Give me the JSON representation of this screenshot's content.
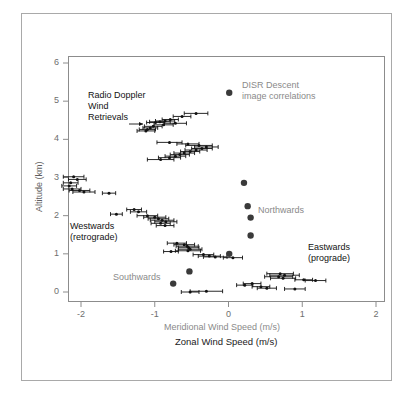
{
  "figure": {
    "title": "",
    "background": "#ffffff",
    "frame_color": "#a9a9a9"
  },
  "chart_data": {
    "type": "scatter",
    "title": "",
    "xlabel": "Zonal Wind Speed (m/s)",
    "xlabel_secondary": "Meridional Wind Speed (m/s)",
    "ylabel": "Altitude (km)",
    "xlim": [
      -2.3,
      2.1
    ],
    "ylim": [
      -0.25,
      6.35
    ],
    "xticks": [
      -2,
      -1,
      0,
      1,
      2
    ],
    "xtick_labels": [
      "-2",
      "-1",
      "0",
      "1",
      "2"
    ],
    "yticks": [
      0,
      1,
      2,
      3,
      4,
      5,
      6
    ],
    "ytick_labels": [
      "0",
      "1",
      "2",
      "3",
      "4",
      "5",
      "6"
    ],
    "grid": false,
    "legend_position": "upper-center",
    "series": [
      {
        "name": "Radio Doppler Wind Retrievals",
        "marker": "small-dot-with-horizontal-errorbar",
        "color": "#111111",
        "xlabel_axis": "Zonal Wind Speed (m/s)",
        "points": [
          {
            "x": -0.44,
            "y": 4.68,
            "xerr": 0.16
          },
          {
            "x": -0.63,
            "y": 4.6,
            "xerr": 0.12
          },
          {
            "x": -0.79,
            "y": 4.52,
            "xerr": 0.11
          },
          {
            "x": -0.86,
            "y": 4.48,
            "xerr": 0.13
          },
          {
            "x": -0.93,
            "y": 4.46,
            "xerr": 0.14
          },
          {
            "x": -0.99,
            "y": 4.44,
            "xerr": 0.12
          },
          {
            "x": -0.72,
            "y": 4.42,
            "xerr": 0.15
          },
          {
            "x": -0.88,
            "y": 4.38,
            "xerr": 0.13
          },
          {
            "x": -1.02,
            "y": 4.34,
            "xerr": 0.12
          },
          {
            "x": -1.06,
            "y": 4.3,
            "xerr": 0.1
          },
          {
            "x": -1.1,
            "y": 4.26,
            "xerr": 0.11
          },
          {
            "x": -1.12,
            "y": 4.22,
            "xerr": 0.12
          },
          {
            "x": -0.8,
            "y": 3.92,
            "xerr": 0.17
          },
          {
            "x": -0.55,
            "y": 3.88,
            "xerr": 0.15
          },
          {
            "x": -0.4,
            "y": 3.84,
            "xerr": 0.18
          },
          {
            "x": -0.3,
            "y": 3.8,
            "xerr": 0.16
          },
          {
            "x": -0.36,
            "y": 3.76,
            "xerr": 0.14
          },
          {
            "x": -0.44,
            "y": 3.72,
            "xerr": 0.15
          },
          {
            "x": -0.52,
            "y": 3.68,
            "xerr": 0.13
          },
          {
            "x": -0.6,
            "y": 3.64,
            "xerr": 0.14
          },
          {
            "x": -0.66,
            "y": 3.6,
            "xerr": 0.13
          },
          {
            "x": -0.72,
            "y": 3.56,
            "xerr": 0.14
          },
          {
            "x": -0.8,
            "y": 3.52,
            "xerr": 0.15
          },
          {
            "x": -0.92,
            "y": 3.47,
            "xerr": 0.18
          },
          {
            "x": -2.1,
            "y": 3.02,
            "xerr": 0.14
          },
          {
            "x": -2.05,
            "y": 2.95,
            "xerr": 0.12
          },
          {
            "x": -2.14,
            "y": 2.86,
            "xerr": 0.1
          },
          {
            "x": -2.16,
            "y": 2.78,
            "xerr": 0.1
          },
          {
            "x": -2.12,
            "y": 2.7,
            "xerr": 0.12
          },
          {
            "x": -2.02,
            "y": 2.66,
            "xerr": 0.14
          },
          {
            "x": -1.96,
            "y": 2.62,
            "xerr": 0.15
          },
          {
            "x": -1.62,
            "y": 2.59,
            "xerr": 0.09
          },
          {
            "x": -1.28,
            "y": 2.16,
            "xerr": 0.1
          },
          {
            "x": -1.22,
            "y": 2.1,
            "xerr": 0.11
          },
          {
            "x": -1.52,
            "y": 2.04,
            "xerr": 0.08
          },
          {
            "x": -1.1,
            "y": 2.0,
            "xerr": 0.14
          },
          {
            "x": -1.0,
            "y": 1.96,
            "xerr": 0.15
          },
          {
            "x": -0.95,
            "y": 1.92,
            "xerr": 0.14
          },
          {
            "x": -0.9,
            "y": 1.88,
            "xerr": 0.16
          },
          {
            "x": -0.85,
            "y": 1.84,
            "xerr": 0.15
          },
          {
            "x": -0.92,
            "y": 1.8,
            "xerr": 0.13
          },
          {
            "x": -0.86,
            "y": 1.74,
            "xerr": 0.12
          },
          {
            "x": -0.7,
            "y": 1.28,
            "xerr": 0.13
          },
          {
            "x": -0.6,
            "y": 1.24,
            "xerr": 0.14
          },
          {
            "x": -0.56,
            "y": 1.2,
            "xerr": 0.15
          },
          {
            "x": -0.54,
            "y": 1.16,
            "xerr": 0.14
          },
          {
            "x": -0.52,
            "y": 1.12,
            "xerr": 0.16
          },
          {
            "x": -0.55,
            "y": 1.08,
            "xerr": 0.17
          },
          {
            "x": -0.78,
            "y": 1.06,
            "xerr": 0.1
          },
          {
            "x": -0.34,
            "y": 0.98,
            "xerr": 0.14
          },
          {
            "x": -0.26,
            "y": 0.94,
            "xerr": 0.15
          },
          {
            "x": -0.18,
            "y": 0.92,
            "xerr": 0.16
          },
          {
            "x": 0.06,
            "y": 0.9,
            "xerr": 0.13
          },
          {
            "x": 0.7,
            "y": 0.48,
            "xerr": 0.18
          },
          {
            "x": 0.76,
            "y": 0.44,
            "xerr": 0.2
          },
          {
            "x": 0.68,
            "y": 0.4,
            "xerr": 0.19
          },
          {
            "x": 0.74,
            "y": 0.36,
            "xerr": 0.17
          },
          {
            "x": 1.02,
            "y": 0.32,
            "xerr": 0.12
          },
          {
            "x": 1.18,
            "y": 0.3,
            "xerr": 0.14
          },
          {
            "x": 0.32,
            "y": 0.22,
            "xerr": 0.12
          },
          {
            "x": 0.22,
            "y": 0.18,
            "xerr": 0.11
          },
          {
            "x": 0.44,
            "y": 0.14,
            "xerr": 0.12
          },
          {
            "x": 0.52,
            "y": 0.1,
            "xerr": 0.13
          },
          {
            "x": 0.9,
            "y": 0.08,
            "xerr": 0.14
          },
          {
            "x": -0.3,
            "y": 0.02,
            "xerr": 0.22
          },
          {
            "x": -0.52,
            "y": 0.0,
            "xerr": 0.12
          }
        ]
      },
      {
        "name": "DISR Descent image correlations",
        "marker": "filled-circle",
        "color": "#3a3a3a",
        "xlabel_axis": "Meridional Wind Speed (m/s)",
        "points": [
          {
            "x": 0.21,
            "y": 2.86
          },
          {
            "x": 0.26,
            "y": 2.25
          },
          {
            "x": 0.3,
            "y": 1.95
          },
          {
            "x": 0.3,
            "y": 1.48
          },
          {
            "x": 0.01,
            "y": 1.0
          },
          {
            "x": -0.53,
            "y": 0.54
          },
          {
            "x": -0.75,
            "y": 0.22
          }
        ]
      }
    ],
    "annotations": [
      {
        "text": "Radio Doppler\nWind\nRetrievals",
        "x": -1.72,
        "y": 5.05,
        "color": "#121212"
      },
      {
        "text": "Westwards\n(retrograde)",
        "x": -2.14,
        "y": 1.52,
        "color": "#121212"
      },
      {
        "text": "Eastwards\n(prograde)",
        "x": 1.08,
        "y": 1.18,
        "color": "#121212"
      },
      {
        "text": "Northwards",
        "x": 0.46,
        "y": 1.92,
        "color": "#8a8a8a"
      },
      {
        "text": "Southwards",
        "x": -1.42,
        "y": 0.22,
        "color": "#8a8a8a"
      }
    ],
    "legend": {
      "marker_x": 0.01,
      "marker_y": 5.22,
      "label": "DISR Descent\nimage correlations",
      "color": "#8a8a8a"
    }
  },
  "axes": {
    "y_title": "Altitude (km)",
    "x_title_primary": "Zonal Wind Speed (m/s)",
    "x_title_secondary": "Meridional Wind Speed (m/s)",
    "x_tick_labels": [
      "-2",
      "-1",
      "0",
      "1",
      "2"
    ],
    "y_tick_labels": [
      "0",
      "1",
      "2",
      "3",
      "4",
      "5",
      "6"
    ]
  },
  "annotations": {
    "radio_doppler": "Radio Doppler",
    "wind": "Wind",
    "retrievals": "Retrievals",
    "westwards": "Westwards",
    "retrograde": "(retrograde)",
    "eastwards": "Eastwards",
    "prograde": "(prograde)",
    "northwards": "Northwards",
    "southwards": "Southwards",
    "legend_line1": "DISR Descent",
    "legend_line2": "image correlations"
  },
  "colors": {
    "data_black": "#111111",
    "disr_gray": "#3a3a3a",
    "label_gray": "#8a8a8a",
    "axis_gray": "#6e6e6e",
    "frame": "#a9a9a9"
  }
}
